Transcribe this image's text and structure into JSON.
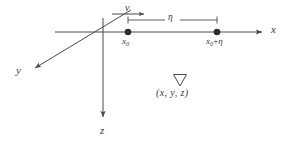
{
  "figure": {
    "type": "diagram",
    "background_color": "#ffffff",
    "stroke_color": "#4a4a4a",
    "text_color": "#3a3a3a",
    "axes": [
      {
        "id": "x-axis",
        "label": "x",
        "direction": "right",
        "arrowhead": true,
        "start": [
          55,
          32
        ],
        "end": [
          266,
          32
        ],
        "label_position": [
          271,
          30
        ]
      },
      {
        "id": "y-axis",
        "label": "y",
        "direction": "down-left",
        "arrowhead": true,
        "start": [
          131,
          10
        ],
        "end": [
          31,
          70
        ],
        "label_position": [
          20,
          71
        ]
      },
      {
        "id": "z-axis",
        "label": "z",
        "direction": "down",
        "arrowhead": true,
        "start": [
          103,
          18
        ],
        "end": [
          103,
          121
        ],
        "label_position": [
          103,
          131
        ]
      }
    ],
    "points": [
      {
        "id": "point-x0",
        "label": "x",
        "label_subscript": "0",
        "label_full": "x₀",
        "position": [
          128,
          32
        ],
        "radius": 3.2,
        "filled": true
      },
      {
        "id": "point-x0-plus-eta",
        "label_prefix": "x",
        "label_subscript": "0",
        "label_operator": "+",
        "label_suffix": "η",
        "label_full": "x₀+η",
        "position": [
          217,
          32
        ],
        "radius": 3.2,
        "filled": true
      }
    ],
    "measure": {
      "id": "eta-span",
      "label": "η",
      "from_x": 128,
      "to_x": 217,
      "y": 20,
      "tick_height": 7,
      "label_position": [
        171,
        18
      ]
    },
    "velocity_arrow": {
      "id": "velocity-v",
      "label": "v",
      "from_x": 112,
      "to_x": 147,
      "y": 14,
      "arrowhead": true,
      "direction": "right",
      "label_position": [
        131,
        7
      ]
    },
    "operator": {
      "id": "nabla",
      "symbol": "▽",
      "name": "nabla-gradient-operator",
      "position": [
        180,
        80
      ],
      "size": 13
    },
    "coordinate_tuple": {
      "id": "coordinate-tuple",
      "text": "(x,  y,  z)",
      "open_paren": "(",
      "components": [
        "x",
        "y",
        "z"
      ],
      "separator": ",",
      "close_paren": ")",
      "position": [
        180,
        95
      ]
    }
  }
}
